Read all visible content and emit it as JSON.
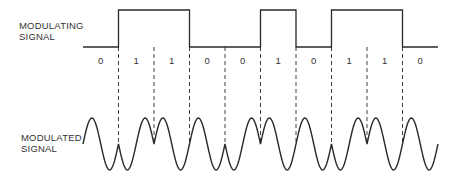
{
  "labels": {
    "modulating_line1": "MODULATING",
    "modulating_line2": "SIGNAL",
    "modulated_line1": "MODULATED",
    "modulated_line2": "SIGNAL"
  },
  "bits": [
    "0",
    "1",
    "1",
    "0",
    "0",
    "1",
    "0",
    "1",
    "1",
    "0"
  ],
  "layout": {
    "x_start": 83,
    "bit_width": 35.5,
    "square_high_y": 10,
    "square_low_y": 47,
    "bit_label_y": 55,
    "dash_top_y": 47,
    "dash_bottom_y": 145,
    "wave_center_y": 144,
    "wave_amplitude": 26,
    "phase_flip_boundaries": [
      1,
      2,
      4,
      5,
      7,
      8
    ]
  },
  "colors": {
    "stroke": "#2a2a2a",
    "text": "#333333"
  }
}
